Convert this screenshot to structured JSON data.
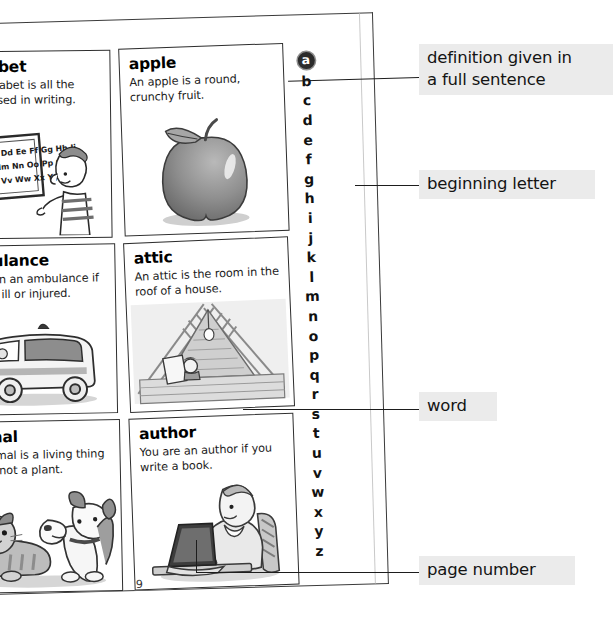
{
  "page": {
    "page_number": "9"
  },
  "entries": [
    {
      "word": "alphabet",
      "definition": "The alphabet is all the letters used in writing.",
      "illustration": "boy-at-blackboard-with-alphabet"
    },
    {
      "word": "apple",
      "definition": "An apple is a round, crunchy fruit.",
      "illustration": "apple-fruit"
    },
    {
      "word": "ambulance",
      "definition": "You go in an ambulance if you are ill or injured.",
      "illustration": "ambulance-van"
    },
    {
      "word": "attic",
      "definition": "An attic is the room in the roof of a house.",
      "illustration": "attic-roof-interior"
    },
    {
      "word": "animal",
      "definition": "An animal is a living thing that is not a plant.",
      "illustration": "cat-and-dog"
    },
    {
      "word": "author",
      "definition": "You are an author if you write a book.",
      "illustration": "person-typing-on-laptop"
    }
  ],
  "alphabet_index": {
    "current_letter": "a",
    "letters": [
      "a",
      "b",
      "c",
      "d",
      "e",
      "f",
      "g",
      "h",
      "i",
      "j",
      "k",
      "l",
      "m",
      "n",
      "o",
      "p",
      "q",
      "r",
      "s",
      "t",
      "u",
      "v",
      "w",
      "x",
      "y",
      "z"
    ]
  },
  "callouts": [
    {
      "id": "definition",
      "text": "definition given in\na full sentence"
    },
    {
      "id": "letter",
      "text": "beginning letter"
    },
    {
      "id": "word",
      "text": "word"
    },
    {
      "id": "page",
      "text": "page number"
    }
  ],
  "colors": {
    "callout_background": "#ebebeb",
    "text": "#141414",
    "line": "#1d1d1d",
    "card_border": "#2e2e2e",
    "index_current_bg": "#2b2b2b"
  }
}
